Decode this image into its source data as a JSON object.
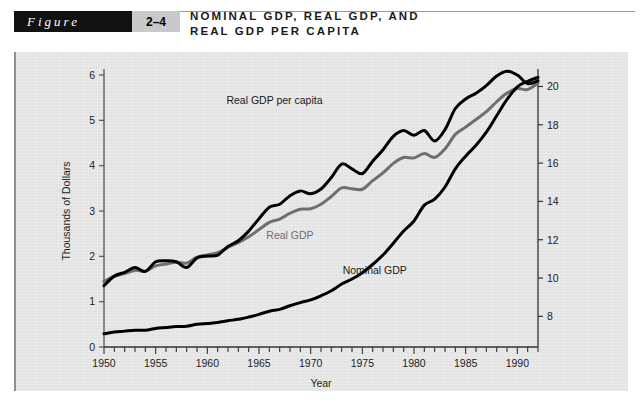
{
  "header": {
    "figure_word": "Figure",
    "figure_number": "2–4",
    "title_line1": "NOMINAL GDP, REAL GDP, AND",
    "title_line2": "REAL GDP PER CAPITA"
  },
  "colors": {
    "panel_background": "#e6e6e6",
    "nominal_gdp": "#000000",
    "real_gdp": "#6e6e6e",
    "real_gdp_per_capita": "#000000",
    "axis": "#555555",
    "figure_tab_background": "#111111",
    "figure_number_background": "#c9c9c9"
  },
  "chart_data": {
    "type": "line",
    "title": "NOMINAL GDP, REAL GDP, AND REAL GDP PER CAPITA",
    "xlabel": "Year",
    "ylabel": "Thousands of Dollars",
    "y2label": "",
    "xlim": [
      1950,
      1992
    ],
    "ylim": [
      0,
      6
    ],
    "y2lim": [
      6.4,
      20.6
    ],
    "grid": false,
    "legend": "inline-annotations",
    "xticks_major": [
      1950,
      1955,
      1960,
      1965,
      1970,
      1975,
      1980,
      1985,
      1990
    ],
    "xticks_minor_step": 1,
    "yticks_left": [
      0,
      1,
      2,
      3,
      4,
      5,
      6
    ],
    "yticks_right": [
      8,
      10,
      12,
      14,
      16,
      18,
      20
    ],
    "x": [
      1950,
      1951,
      1952,
      1953,
      1954,
      1955,
      1956,
      1957,
      1958,
      1959,
      1960,
      1961,
      1962,
      1963,
      1964,
      1965,
      1966,
      1967,
      1968,
      1969,
      1970,
      1971,
      1972,
      1973,
      1974,
      1975,
      1976,
      1977,
      1978,
      1979,
      1980,
      1981,
      1982,
      1983,
      1984,
      1985,
      1986,
      1987,
      1988,
      1989,
      1990,
      1991,
      1992
    ],
    "series": [
      {
        "name": "Nominal GDP",
        "axis": "left",
        "color": "#000000",
        "label_x": 1976.2,
        "label_y": 1.62,
        "values": [
          0.29,
          0.33,
          0.35,
          0.37,
          0.37,
          0.41,
          0.43,
          0.45,
          0.46,
          0.5,
          0.52,
          0.54,
          0.58,
          0.61,
          0.66,
          0.72,
          0.79,
          0.83,
          0.91,
          0.98,
          1.04,
          1.13,
          1.24,
          1.39,
          1.5,
          1.64,
          1.82,
          2.03,
          2.29,
          2.56,
          2.78,
          3.13,
          3.26,
          3.53,
          3.93,
          4.21,
          4.45,
          4.74,
          5.1,
          5.46,
          5.74,
          5.86,
          5.95
        ]
      },
      {
        "name": "Real GDP",
        "axis": "left",
        "color": "#6e6e6e",
        "label_x": 1968.0,
        "label_y": 2.38,
        "values": [
          1.45,
          1.56,
          1.62,
          1.69,
          1.67,
          1.79,
          1.83,
          1.87,
          1.85,
          1.98,
          2.03,
          2.08,
          2.2,
          2.3,
          2.43,
          2.59,
          2.75,
          2.82,
          2.95,
          3.04,
          3.05,
          3.15,
          3.32,
          3.51,
          3.49,
          3.48,
          3.67,
          3.84,
          4.05,
          4.18,
          4.17,
          4.27,
          4.18,
          4.37,
          4.69,
          4.85,
          5.02,
          5.19,
          5.41,
          5.6,
          5.7,
          5.68,
          5.82
        ]
      },
      {
        "name": "Real GDP per capita",
        "axis": "right",
        "color": "#000000",
        "label_x": 1966.5,
        "label_y": 5.36,
        "values": [
          9.6,
          10.1,
          10.3,
          10.55,
          10.35,
          10.85,
          10.9,
          10.85,
          10.55,
          11.05,
          11.15,
          11.2,
          11.65,
          11.95,
          12.45,
          13.1,
          13.7,
          13.85,
          14.3,
          14.55,
          14.4,
          14.65,
          15.25,
          15.95,
          15.7,
          15.45,
          16.1,
          16.7,
          17.4,
          17.7,
          17.45,
          17.7,
          17.15,
          17.75,
          18.85,
          19.35,
          19.65,
          20.05,
          20.55,
          20.8,
          20.6,
          20.15,
          20.3
        ]
      }
    ]
  }
}
